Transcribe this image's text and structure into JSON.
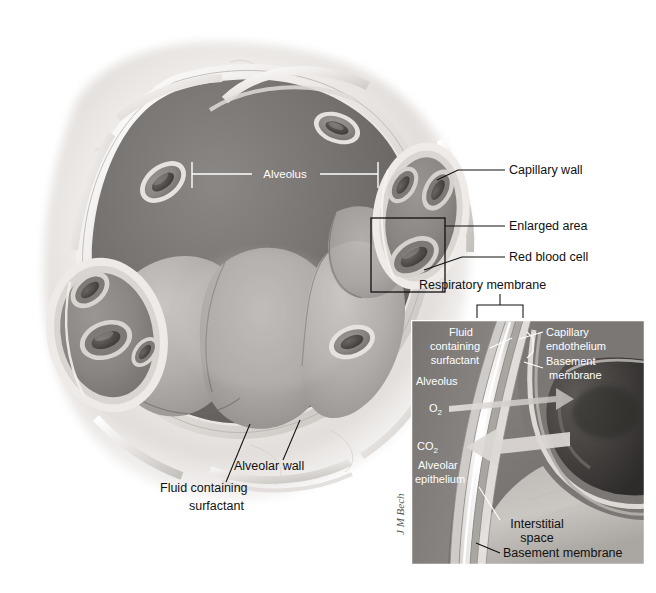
{
  "figure": {
    "signature": "J M Bech",
    "background": "#ffffff"
  },
  "palette": {
    "tissue_light": "#f2f0ee",
    "tissue_mid": "#d6d2cd",
    "tissue_shadow": "#b6b1ab",
    "alveolus_dark": "#6e6a68",
    "alveolus_mid": "#8d8987",
    "alveolus_light": "#b9b5b2",
    "capillary_fill": "#8a8683",
    "rbc_dark": "#4a4745",
    "wall_highlight": "#ffffff",
    "label_text": "#111111",
    "label_text_inverse": "#ffffff",
    "inset_border": "#ffffff",
    "leader_line": "#111111"
  },
  "main_labels": [
    {
      "id": "alveolus-center",
      "text": "Alveolus",
      "color": "#ffffff",
      "x": 285,
      "y": 178,
      "anchor": "middle"
    },
    {
      "id": "capillary-wall",
      "text": "Capillary wall",
      "color": "#111111",
      "x": 509,
      "y": 174,
      "anchor": "start"
    },
    {
      "id": "enlarged-area",
      "text": "Enlarged area",
      "color": "#111111",
      "x": 509,
      "y": 230,
      "anchor": "start"
    },
    {
      "id": "red-blood-cell",
      "text": "Red blood cell",
      "color": "#111111",
      "x": 509,
      "y": 261,
      "anchor": "start"
    },
    {
      "id": "respiratory-membrane",
      "text": "Respiratory membrane",
      "color": "#111111",
      "x": 419,
      "y": 289,
      "anchor": "start"
    },
    {
      "id": "alveolar-wall",
      "text": "Alveolar wall",
      "color": "#111111",
      "x": 234,
      "y": 470,
      "anchor": "start"
    },
    {
      "id": "fluid-containing-1",
      "text": "Fluid containing",
      "color": "#111111",
      "x": 160,
      "y": 492,
      "anchor": "start"
    },
    {
      "id": "fluid-containing-2",
      "text": "surfactant",
      "color": "#111111",
      "x": 189,
      "y": 510,
      "anchor": "start"
    }
  ],
  "inset": {
    "bounds": {
      "x": 411,
      "y": 320,
      "width": 234,
      "height": 245
    },
    "labels": [
      {
        "id": "inset-fluid-1",
        "text": "Fluid",
        "x": 461,
        "y": 336,
        "anchor": "middle"
      },
      {
        "id": "inset-fluid-2",
        "text": "containing",
        "x": 455,
        "y": 350,
        "anchor": "middle"
      },
      {
        "id": "inset-fluid-3",
        "text": "surfactant",
        "x": 455,
        "y": 364,
        "anchor": "middle"
      },
      {
        "id": "inset-alveolus",
        "text": "Alveolus",
        "x": 416,
        "y": 385,
        "anchor": "start"
      },
      {
        "id": "inset-o2",
        "text": "O",
        "sub": "2",
        "x": 429,
        "y": 412,
        "anchor": "start"
      },
      {
        "id": "inset-co2",
        "text": "CO",
        "sub": "2",
        "x": 417,
        "y": 450,
        "anchor": "start"
      },
      {
        "id": "inset-alveolar-epi-1",
        "text": "Alveolar",
        "x": 418,
        "y": 469,
        "anchor": "start"
      },
      {
        "id": "inset-alveolar-epi-2",
        "text": "epithelium",
        "x": 415,
        "y": 483,
        "anchor": "start"
      },
      {
        "id": "inset-capillary-endo-1",
        "text": "Capillary",
        "x": 546,
        "y": 336,
        "anchor": "start"
      },
      {
        "id": "inset-capillary-endo-2",
        "text": "endothelium",
        "x": 546,
        "y": 350,
        "anchor": "start"
      },
      {
        "id": "inset-basement-1",
        "text": "Basement",
        "x": 546,
        "y": 365,
        "anchor": "start"
      },
      {
        "id": "inset-basement-2",
        "text": "membrane",
        "x": 549,
        "y": 379,
        "anchor": "start"
      },
      {
        "id": "inset-interstitial-1",
        "text": "Interstitial",
        "x": 537,
        "y": 528,
        "anchor": "middle"
      },
      {
        "id": "inset-interstitial-2",
        "text": "space",
        "x": 537,
        "y": 542,
        "anchor": "middle"
      },
      {
        "id": "inset-basement-membrane-bottom",
        "text": "Basement membrane",
        "x": 503,
        "y": 557,
        "anchor": "start"
      }
    ],
    "gas_arrows": [
      {
        "id": "o2-arrow",
        "label": "O2",
        "direction": "right"
      },
      {
        "id": "co2-arrow",
        "label": "CO2",
        "direction": "left"
      }
    ]
  }
}
